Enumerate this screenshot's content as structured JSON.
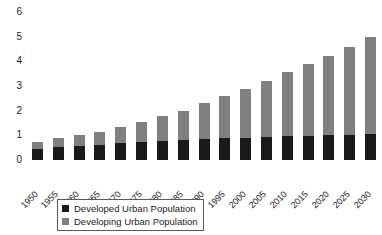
{
  "chart_data": {
    "type": "bar",
    "subtype": "stacked-bar",
    "title": "",
    "subtitle": "",
    "xlabel": "",
    "ylabel": "",
    "ylim": [
      0,
      6
    ],
    "y_ticks": [
      0,
      1,
      2,
      3,
      4,
      5,
      6
    ],
    "grid": false,
    "legend_position": "bottom-center",
    "x_tick_rotation": -45,
    "categories": [
      "1950",
      "1955",
      "1960",
      "1965",
      "1970",
      "1975",
      "1980",
      "1985",
      "1990",
      "1995",
      "2000",
      "2005",
      "2010",
      "2015",
      "2020",
      "2025",
      "2030"
    ],
    "series": [
      {
        "name": "Developed Urban Population",
        "color": "#1a1a1a",
        "values": [
          0.45,
          0.52,
          0.57,
          0.62,
          0.67,
          0.73,
          0.77,
          0.81,
          0.85,
          0.88,
          0.91,
          0.94,
          0.97,
          0.99,
          1.01,
          1.03,
          1.05
        ]
      },
      {
        "name": "Developing Urban Population",
        "color": "#808080",
        "values": [
          0.3,
          0.36,
          0.45,
          0.53,
          0.66,
          0.82,
          1.03,
          1.19,
          1.45,
          1.7,
          1.97,
          2.26,
          2.58,
          2.89,
          3.19,
          3.57,
          3.95
        ]
      }
    ],
    "totals": [
      0.75,
      0.88,
      1.02,
      1.15,
      1.33,
      1.55,
      1.8,
      2.0,
      2.3,
      2.58,
      2.88,
      3.2,
      3.55,
      3.88,
      4.2,
      4.6,
      5.0
    ]
  },
  "legend": {
    "items": [
      {
        "label": "Developed Urban Population",
        "swatch": "legend-swatch-developed"
      },
      {
        "label": "Developing Urban Population",
        "swatch": "legend-swatch-developing"
      }
    ]
  }
}
